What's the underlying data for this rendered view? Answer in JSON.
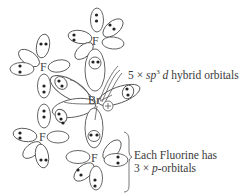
{
  "diagram": {
    "central_atom": {
      "symbol": "Br",
      "charge_symbol": "⊕"
    },
    "ligands": [
      {
        "symbol": "F",
        "position": "top"
      },
      {
        "symbol": "F",
        "position": "upper-left"
      },
      {
        "symbol": "F",
        "position": "lower-left"
      },
      {
        "symbol": "F",
        "position": "bottom"
      },
      {
        "symbol": "F",
        "position": "right"
      }
    ],
    "annotations": {
      "hybrid": {
        "prefix": "5 × ",
        "sp": "sp",
        "sup": "3",
        "d": " d",
        "suffix": " hybrid orbitals"
      },
      "fluorine_line1": "Each Fluorine has",
      "fluorine_line2_prefix": "3 × ",
      "fluorine_line2_p": "p",
      "fluorine_line2_suffix": "-orbitals"
    },
    "colors": {
      "line": "#555555",
      "text": "#3a3a3a",
      "background": "#ffffff"
    }
  }
}
